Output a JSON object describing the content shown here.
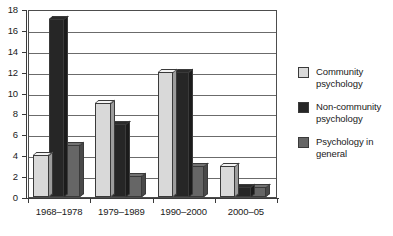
{
  "chart_data": {
    "type": "bar",
    "title": "",
    "subtitle": "",
    "xlabel": "",
    "ylabel": "",
    "categories": [
      "1968–1978",
      "1979–1989",
      "1990–2000",
      "2000–05"
    ],
    "series": [
      {
        "name": "Community psychology",
        "color": "#d9d9d9",
        "values": [
          4,
          9,
          12,
          3
        ]
      },
      {
        "name": "Non-community psychology",
        "color": "#262626",
        "values": [
          17,
          7,
          12,
          1
        ]
      },
      {
        "name": "Psychology in general",
        "color": "#666666",
        "values": [
          5,
          2,
          3,
          1
        ]
      }
    ],
    "ylim": [
      0,
      18
    ],
    "y_ticks": [
      0,
      2,
      4,
      6,
      8,
      10,
      12,
      14,
      16,
      18
    ],
    "y_tick_labels": [
      "0",
      "2",
      "4",
      "6",
      "8",
      "10",
      "12",
      "14",
      "16",
      "18"
    ],
    "grid": true,
    "grid_axis": "y",
    "legend_position": "right",
    "style_3d": true
  },
  "legend": {
    "items": [
      {
        "label_line1": "Community",
        "label_line2": "psychology",
        "swatch": "#d9d9d9"
      },
      {
        "label_line1": "Non-community",
        "label_line2": "psychology",
        "swatch": "#262626"
      },
      {
        "label_line1": "Psychology in",
        "label_line2": "general",
        "swatch": "#666666"
      }
    ]
  }
}
